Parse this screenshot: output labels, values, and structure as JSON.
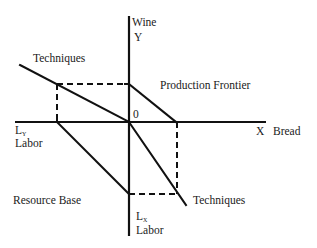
{
  "diagram": {
    "axes": {
      "y_top_label": "Wine",
      "y_top_symbol": "Y",
      "x_right_symbol": "X",
      "x_right_label": "Bread",
      "origin_label": "0",
      "x_left_symbol": "L",
      "x_left_subscript": "Y",
      "x_left_label": "Labor",
      "y_bottom_symbol": "L",
      "y_bottom_subscript": "X",
      "y_bottom_label": "Labor"
    },
    "labels": {
      "techniques_upper": "Techniques",
      "production_frontier": "Production Frontier",
      "resource_base": "Resource Base",
      "techniques_lower": "Techniques"
    }
  }
}
